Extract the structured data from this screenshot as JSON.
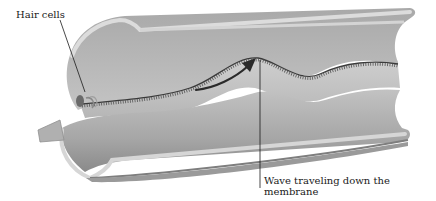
{
  "diagram": {
    "labels": {
      "hair_cells": "Hair cells",
      "wave_line1": "Wave traveling down the",
      "wave_line2": "membrane"
    },
    "colors": {
      "tube_outer": "#b9b9b9",
      "tube_inner": "#c9c9c9",
      "tube_rim": "#d9d9d9",
      "tube_shadow": "#8e8e8e",
      "membrane_edge": "#3a3a3a",
      "arrow": "#2a2a2a",
      "leader_line": "#1a1a1a",
      "text": "#1a1a1a",
      "background": "#ffffff"
    },
    "annotations": [
      {
        "id": "hair-cells",
        "text": "Hair cells",
        "anchor": [
          85,
          92
        ]
      },
      {
        "id": "wave",
        "text": "Wave traveling down the membrane",
        "anchor": [
          260,
          70
        ]
      }
    ]
  }
}
